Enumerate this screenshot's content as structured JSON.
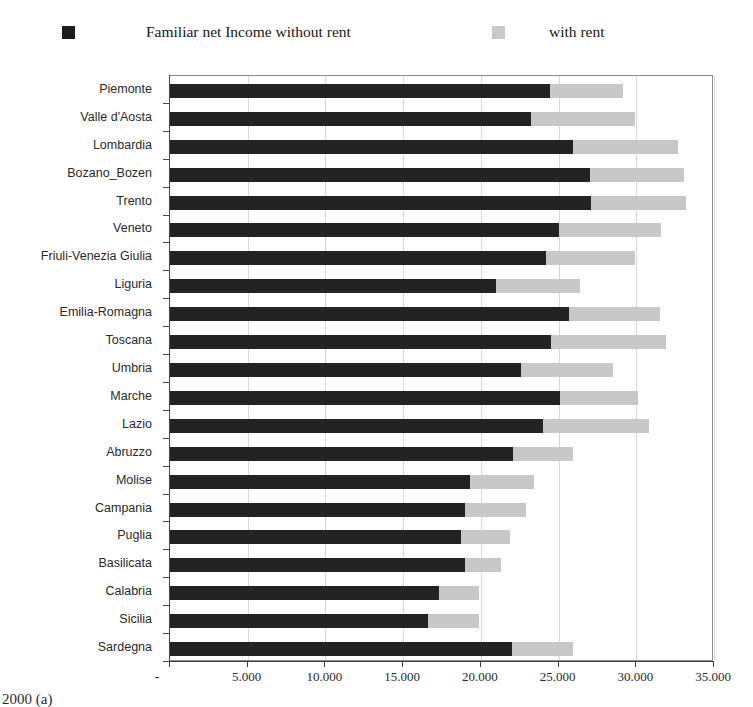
{
  "legend": {
    "entries": [
      {
        "label": "Familiar net Income without rent",
        "swatch": "dark-square-marker",
        "color": "#1b1b1b"
      },
      {
        "label": "with rent",
        "swatch": "light-square-marker",
        "color": "#c9c9c9"
      }
    ]
  },
  "bottom_caption": "2000 (a)",
  "chart_data": {
    "type": "bar",
    "orientation": "horizontal",
    "stacked": true,
    "title": "",
    "subtitle": "",
    "xlabel": "",
    "ylabel": "",
    "xlim": [
      0,
      35000
    ],
    "ylim": null,
    "grid": true,
    "legend_position": "top",
    "xticks": [
      0,
      5000,
      10000,
      15000,
      20000,
      25000,
      30000,
      35000
    ],
    "xticklabels": [
      "-",
      "5.000",
      "10.000",
      "15.000",
      "20.000",
      "25.000",
      "30.000",
      "35.000"
    ],
    "categories": [
      "Piemonte",
      "Valle d'Aosta",
      "Lombardia",
      "Bozano_Bozen",
      "Trento",
      "Veneto",
      "Friuli-Venezia Giulia",
      "Liguria",
      "Emilia-Romagna",
      "Toscana",
      "Umbria",
      "Marche",
      "Lazio",
      "Abruzzo",
      "Molise",
      "Campania",
      "Puglia",
      "Basilicata",
      "Calabria",
      "Sicilia",
      "Sardegna"
    ],
    "series": [
      {
        "name": "Familiar net Income without rent",
        "color": "#232323",
        "values": [
          24450,
          23200,
          25900,
          27000,
          27100,
          25000,
          24200,
          21000,
          25700,
          24500,
          22600,
          25100,
          24000,
          22100,
          19300,
          19000,
          18700,
          19000,
          17300,
          16600,
          22000
        ]
      },
      {
        "name": "with rent",
        "color": "#c8c8c8",
        "note": "total including rent; rendered as the remainder segment of the stacked bar",
        "values": [
          29150,
          29900,
          32700,
          33100,
          33200,
          31600,
          29950,
          26400,
          31500,
          31900,
          28500,
          30100,
          30800,
          25900,
          23400,
          22900,
          21900,
          21300,
          19900,
          19900,
          25900
        ]
      }
    ]
  }
}
